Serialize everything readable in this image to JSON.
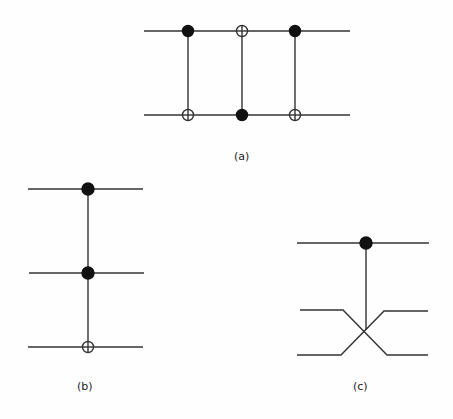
{
  "diagram": {
    "panels": [
      {
        "id": "a",
        "label": "(a)",
        "description": "Two qubit wires with three alternating CNOT gates (SWAP decomposition)",
        "wires": [
          31,
          115
        ],
        "gates": [
          {
            "x": 188,
            "control_wire": 0,
            "target_wire": 1
          },
          {
            "x": 242,
            "control_wire": 1,
            "target_wire": 0
          },
          {
            "x": 295,
            "control_wire": 0,
            "target_wire": 1
          }
        ]
      },
      {
        "id": "b",
        "label": "(b)",
        "description": "Three qubit wires with Toffoli gate: two controls, one target",
        "wires": [
          189,
          273,
          347
        ],
        "gates": [
          {
            "x": 88,
            "controls": [
              0,
              1
            ],
            "target_wire": 2
          }
        ]
      },
      {
        "id": "c",
        "label": "(c)",
        "description": "Controlled-SWAP (Fredkin) gate: control on top wire, crossing of bottom two wires",
        "wires": [
          243,
          311,
          355
        ],
        "gates": [
          {
            "x": 366,
            "control_wire": 0,
            "swap_wires": [
              1,
              2
            ]
          }
        ]
      }
    ],
    "colors": {
      "line": "#333333",
      "dot": "#111111",
      "background": "#fefefe"
    }
  }
}
